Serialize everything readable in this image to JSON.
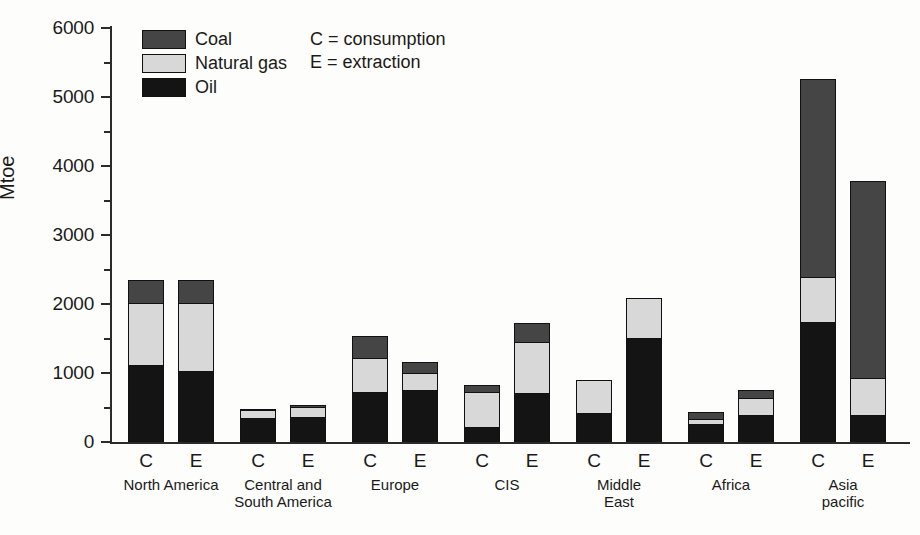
{
  "chart_data": {
    "type": "bar",
    "subtype": "stacked-grouped",
    "title": "",
    "xlabel": "",
    "ylabel": "Mtoe",
    "ylim": [
      0,
      6000
    ],
    "ytick_labels": [
      "0",
      "1000",
      "2000",
      "3000",
      "4000",
      "5000",
      "6000"
    ],
    "ytick_values": [
      0,
      1000,
      2000,
      3000,
      4000,
      5000,
      6000
    ],
    "yminor_values": [
      500,
      1500,
      2500,
      3500,
      4500,
      5500
    ],
    "grid": false,
    "legend_position": "top-left",
    "series": [
      {
        "name": "Oil",
        "color": "#141414"
      },
      {
        "name": "Natural gas",
        "color": "#d8d8d8"
      },
      {
        "name": "Coal",
        "color": "#454545"
      }
    ],
    "categories": [
      "North America",
      "Central and South America",
      "Europe",
      "CIS",
      "Middle East",
      "Africa",
      "Asia pacific"
    ],
    "bar_types": [
      "C",
      "E"
    ],
    "annotations": [
      "C = consumption",
      "E = extraction"
    ],
    "groups": [
      {
        "category": "North America",
        "label_line1": "North America",
        "label_line2": "",
        "bars": [
          {
            "type": "C",
            "oil": 1120,
            "natural_gas": 900,
            "coal": 330,
            "total": 2350
          },
          {
            "type": "E",
            "oil": 1030,
            "natural_gas": 980,
            "coal": 340,
            "total": 2350
          }
        ]
      },
      {
        "category": "Central and South America",
        "label_line1": "Central and",
        "label_line2": "South America",
        "bars": [
          {
            "type": "C",
            "oil": 350,
            "natural_gas": 110,
            "coal": 20,
            "total": 480
          },
          {
            "type": "E",
            "oil": 360,
            "natural_gas": 150,
            "coal": 25,
            "total": 535
          }
        ]
      },
      {
        "category": "Europe",
        "label_line1": "Europe",
        "label_line2": "",
        "bars": [
          {
            "type": "C",
            "oil": 725,
            "natural_gas": 490,
            "coal": 315,
            "total": 1530
          },
          {
            "type": "E",
            "oil": 755,
            "natural_gas": 250,
            "coal": 155,
            "total": 1160
          }
        ]
      },
      {
        "category": "CIS",
        "label_line1": "CIS",
        "label_line2": "",
        "bars": [
          {
            "type": "C",
            "oil": 220,
            "natural_gas": 505,
            "coal": 105,
            "total": 830
          },
          {
            "type": "E",
            "oil": 710,
            "natural_gas": 740,
            "coal": 275,
            "total": 1725
          }
        ]
      },
      {
        "category": "Middle East",
        "label_line1": "Middle",
        "label_line2": "East",
        "bars": [
          {
            "type": "C",
            "oil": 420,
            "natural_gas": 480,
            "coal": 0,
            "total": 900
          },
          {
            "type": "E",
            "oil": 1505,
            "natural_gas": 585,
            "coal": 0,
            "total": 2090
          }
        ]
      },
      {
        "category": "Africa",
        "label_line1": "Africa",
        "label_line2": "",
        "bars": [
          {
            "type": "C",
            "oil": 260,
            "natural_gas": 80,
            "coal": 90,
            "total": 430
          },
          {
            "type": "E",
            "oil": 390,
            "natural_gas": 250,
            "coal": 110,
            "total": 750
          }
        ]
      },
      {
        "category": "Asia pacific",
        "label_line1": "Asia",
        "label_line2": "pacific",
        "bars": [
          {
            "type": "C",
            "oil": 1740,
            "natural_gas": 655,
            "coal": 2865,
            "total": 5260
          },
          {
            "type": "E",
            "oil": 390,
            "natural_gas": 540,
            "coal": 2855,
            "total": 3785
          }
        ]
      }
    ]
  },
  "legend": {
    "items": [
      {
        "label": "Coal",
        "color": "#454545"
      },
      {
        "label": "Natural gas",
        "color": "#d8d8d8"
      },
      {
        "label": "Oil",
        "color": "#141414"
      }
    ]
  },
  "notes": {
    "line1": "C = consumption",
    "line2": "E = extraction"
  },
  "axis": {
    "y_title": "Mtoe"
  }
}
